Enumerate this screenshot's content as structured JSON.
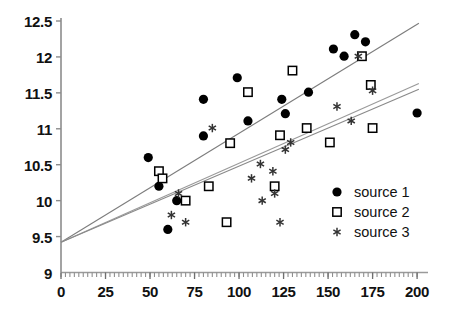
{
  "chart_data": {
    "type": "scatter",
    "title": "",
    "xlabel": "",
    "ylabel": "",
    "xlim": [
      0,
      205
    ],
    "ylim": [
      9,
      12.5
    ],
    "xticks": [
      0,
      25,
      50,
      75,
      100,
      125,
      150,
      175,
      200
    ],
    "xtick_labels": [
      "0",
      "25",
      "50",
      "75",
      "100",
      "125",
      "150",
      "175",
      "200"
    ],
    "yticks": [
      9,
      9.5,
      10,
      10.5,
      11,
      11.5,
      12,
      12.5
    ],
    "ytick_labels": [
      "9",
      "9.5",
      "10",
      "10.5",
      "11",
      "11.5",
      "12",
      "12.5"
    ],
    "grid": false,
    "legend_position": "lower-right",
    "series": [
      {
        "name": "source 1",
        "marker": "filled-circle",
        "color": "#000000",
        "points": [
          [
            49,
            10.6
          ],
          [
            55,
            10.2
          ],
          [
            60,
            9.6
          ],
          [
            65,
            10.0
          ],
          [
            80,
            11.41
          ],
          [
            80,
            10.9
          ],
          [
            99,
            11.71
          ],
          [
            105,
            11.11
          ],
          [
            124,
            11.41
          ],
          [
            126,
            11.21
          ],
          [
            139,
            11.51
          ],
          [
            153,
            12.11
          ],
          [
            159,
            12.01
          ],
          [
            165,
            12.31
          ],
          [
            171,
            12.21
          ],
          [
            200,
            11.22
          ]
        ]
      },
      {
        "name": "source 2",
        "marker": "open-square",
        "color": "#000000",
        "points": [
          [
            55,
            10.41
          ],
          [
            57,
            10.31
          ],
          [
            70,
            10.0
          ],
          [
            83,
            10.2
          ],
          [
            93,
            9.7
          ],
          [
            95,
            10.8
          ],
          [
            105,
            11.51
          ],
          [
            120,
            10.2
          ],
          [
            123,
            10.91
          ],
          [
            130,
            11.81
          ],
          [
            138,
            11.01
          ],
          [
            151,
            10.81
          ],
          [
            169,
            12.01
          ],
          [
            174,
            11.61
          ],
          [
            175,
            11.01
          ]
        ]
      },
      {
        "name": "source 3",
        "marker": "asterisk",
        "color": "#333333",
        "points": [
          [
            62,
            9.8
          ],
          [
            66,
            10.1
          ],
          [
            70,
            9.7
          ],
          [
            85,
            11.01
          ],
          [
            107,
            10.31
          ],
          [
            112,
            10.51
          ],
          [
            113,
            10.0
          ],
          [
            119,
            10.41
          ],
          [
            120,
            10.1
          ],
          [
            123,
            9.7
          ],
          [
            126,
            10.71
          ],
          [
            129,
            10.81
          ],
          [
            155,
            11.31
          ],
          [
            163,
            11.11
          ],
          [
            167,
            12.01
          ],
          [
            175,
            11.53
          ]
        ]
      }
    ],
    "trend_lines": [
      {
        "for_series": "source 1",
        "x0": 0,
        "y0": 9.42,
        "x1": 201,
        "y1": 12.47,
        "color": "#7d7d7d"
      },
      {
        "for_series": "source 2",
        "x0": 0,
        "y0": 9.42,
        "x1": 201,
        "y1": 11.63,
        "color": "#9a9a9a"
      },
      {
        "for_series": "source 3",
        "x0": 0,
        "y0": 9.42,
        "x1": 201,
        "y1": 11.55,
        "color": "#8a8a8a"
      }
    ]
  },
  "legend": {
    "items": [
      {
        "label": "source 1",
        "marker": "filled-circle"
      },
      {
        "label": "source 2",
        "marker": "open-square"
      },
      {
        "label": "source 3",
        "marker": "asterisk"
      }
    ]
  }
}
